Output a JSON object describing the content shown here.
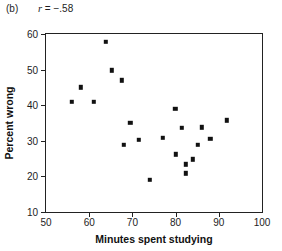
{
  "figure": {
    "panel_label": "(b)",
    "correlation_symbol": "r",
    "correlation_text": " = −.58",
    "correlation_full": "r = −.58"
  },
  "chart_data": {
    "type": "scatter",
    "title": "(b)   r = −.58",
    "annotations": [
      "(b)",
      "r = −.58"
    ],
    "xlabel": "Minutes spent studying",
    "ylabel": "Percent wrong",
    "xlim": [
      50,
      100
    ],
    "ylim": [
      10,
      60
    ],
    "xticks": [
      50,
      60,
      70,
      80,
      90,
      100
    ],
    "yticks": [
      10,
      20,
      30,
      40,
      50,
      60
    ],
    "xtick_labels": [
      "50",
      "60",
      "70",
      "80",
      "90",
      "100"
    ],
    "ytick_labels": [
      "10",
      "20",
      "30",
      "40",
      "50",
      "60"
    ],
    "grid": false,
    "legend": false,
    "marker": "square",
    "marker_color": "#111111",
    "r": -0.58,
    "n": 23,
    "points": [
      {
        "x": 56.0,
        "y": 41.0
      },
      {
        "x": 58.0,
        "y": 45.0
      },
      {
        "x": 61.0,
        "y": 41.0
      },
      {
        "x": 63.8,
        "y": 57.8
      },
      {
        "x": 65.2,
        "y": 49.8
      },
      {
        "x": 67.5,
        "y": 47.0
      },
      {
        "x": 68.0,
        "y": 28.8
      },
      {
        "x": 69.5,
        "y": 35.0
      },
      {
        "x": 71.5,
        "y": 30.3
      },
      {
        "x": 74.0,
        "y": 19.0
      },
      {
        "x": 77.0,
        "y": 30.8
      },
      {
        "x": 79.9,
        "y": 39.0
      },
      {
        "x": 80.0,
        "y": 26.2
      },
      {
        "x": 81.5,
        "y": 33.6
      },
      {
        "x": 82.3,
        "y": 23.4
      },
      {
        "x": 82.3,
        "y": 20.9
      },
      {
        "x": 84.0,
        "y": 24.8
      },
      {
        "x": 85.2,
        "y": 28.9
      },
      {
        "x": 86.0,
        "y": 33.8
      },
      {
        "x": 88.0,
        "y": 30.6
      },
      {
        "x": 91.8,
        "y": 35.8
      }
    ]
  }
}
